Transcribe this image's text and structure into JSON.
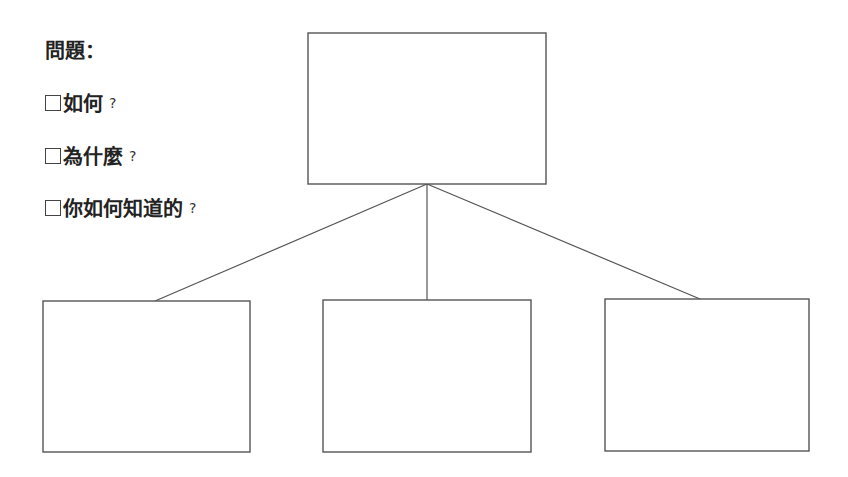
{
  "questions": {
    "title": "問題：",
    "items": [
      {
        "text": "如何",
        "mark": "?",
        "checked": false
      },
      {
        "text": "為什麼",
        "mark": "?",
        "checked": false
      },
      {
        "text": "你如何知道的",
        "mark": "?",
        "checked": false
      }
    ]
  },
  "diagram": {
    "type": "tree",
    "root": {
      "label": "",
      "x": 308,
      "y": 33,
      "w": 238,
      "h": 151
    },
    "children": [
      {
        "label": "",
        "x": 43,
        "y": 301,
        "w": 207,
        "h": 151
      },
      {
        "label": "",
        "x": 323,
        "y": 300,
        "w": 208,
        "h": 152
      },
      {
        "label": "",
        "x": 605,
        "y": 299,
        "w": 204,
        "h": 152
      }
    ],
    "edges": [
      {
        "from": [
          427,
          184
        ],
        "to": [
          155,
          301
        ]
      },
      {
        "from": [
          427,
          184
        ],
        "to": [
          427,
          300
        ]
      },
      {
        "from": [
          427,
          184
        ],
        "to": [
          700,
          299
        ]
      }
    ],
    "colors": {
      "stroke": "#555555",
      "fill": "#ffffff"
    }
  }
}
